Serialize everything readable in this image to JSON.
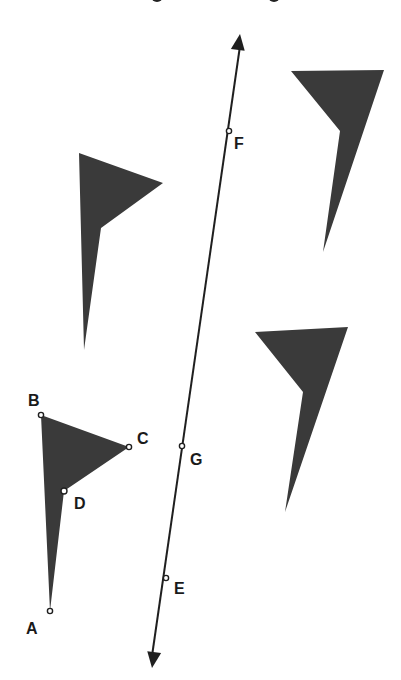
{
  "figure": {
    "colors": {
      "shape_fill": "#3a3a3a",
      "line": "#1f1f1f",
      "point_stroke": "#1f1f1f",
      "point_fill": "#ffffff",
      "label": "#1a1a1a",
      "background": "#ffffff"
    }
  },
  "line": {
    "name": "line EF",
    "start": {
      "x": 152,
      "y": 668
    },
    "end": {
      "x": 240,
      "y": 34
    },
    "arrows": "both"
  },
  "points": [
    {
      "label": "A",
      "x": 50,
      "y": 611,
      "label_x": 26,
      "label_y": 621
    },
    {
      "label": "B",
      "x": 41,
      "y": 415,
      "label_x": 28,
      "label_y": 393
    },
    {
      "label": "C",
      "x": 129,
      "y": 447,
      "label_x": 137,
      "label_y": 431
    },
    {
      "label": "D",
      "x": 64,
      "y": 491,
      "label_x": 74,
      "label_y": 496
    },
    {
      "label": "E",
      "x": 166,
      "y": 578,
      "label_x": 174,
      "label_y": 581
    },
    {
      "label": "F",
      "x": 229,
      "y": 131,
      "label_x": 234,
      "label_y": 136
    },
    {
      "label": "G",
      "x": 182,
      "y": 446,
      "label_x": 190,
      "label_y": 452
    }
  ],
  "shapes": [
    {
      "name": "figure-ABCD",
      "vertices": [
        [
          50,
          611
        ],
        [
          41,
          415
        ],
        [
          129,
          447
        ],
        [
          64,
          491
        ]
      ]
    },
    {
      "name": "figure-upper-left",
      "vertices": [
        [
          84,
          350
        ],
        [
          79,
          153
        ],
        [
          163,
          183
        ],
        [
          101,
          228
        ]
      ]
    },
    {
      "name": "figure-upper-right",
      "vertices": [
        [
          323,
          252
        ],
        [
          340,
          131
        ],
        [
          291,
          71
        ],
        [
          384,
          70
        ]
      ]
    },
    {
      "name": "figure-lower-right",
      "vertices": [
        [
          285,
          512
        ],
        [
          303,
          392
        ],
        [
          255,
          332
        ],
        [
          348,
          327
        ]
      ]
    }
  ]
}
